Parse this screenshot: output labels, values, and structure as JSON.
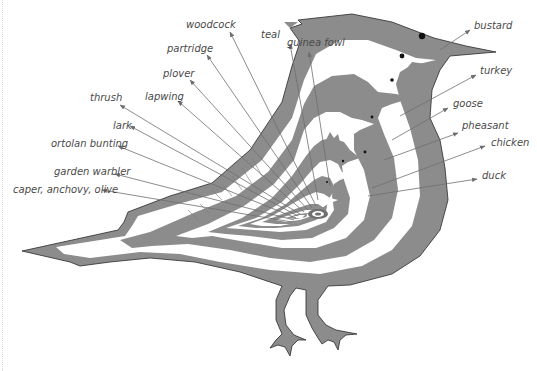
{
  "diagram": {
    "type": "nested-animals (roti sans pareil)",
    "colors": {
      "fill": "#8c8c8c",
      "inner_fill": "#ffffff",
      "outline": "#2a2a2a",
      "arrow": "#6e6e6e",
      "label": "#4a4a4a"
    },
    "labels_left": [
      {
        "id": "woodcock",
        "text": "woodcock"
      },
      {
        "id": "partridge",
        "text": "partridge"
      },
      {
        "id": "plover",
        "text": "plover"
      },
      {
        "id": "lapwing",
        "text": "lapwing"
      },
      {
        "id": "thrush",
        "text": "thrush"
      },
      {
        "id": "lark",
        "text": "lark"
      },
      {
        "id": "ortolan-bunting",
        "text": "ortolan bunting"
      },
      {
        "id": "garden-warbler",
        "text": "garden warbler"
      },
      {
        "id": "caper-anchovy-olive",
        "text": "caper, anchovy, olive"
      }
    ],
    "labels_top": [
      {
        "id": "teal",
        "text": "teal"
      },
      {
        "id": "guinea-fowl",
        "text": "guinea fowl"
      }
    ],
    "labels_right": [
      {
        "id": "bustard",
        "text": "bustard"
      },
      {
        "id": "turkey",
        "text": "turkey"
      },
      {
        "id": "goose",
        "text": "goose"
      },
      {
        "id": "pheasant",
        "text": "pheasant"
      },
      {
        "id": "chicken",
        "text": "chicken"
      },
      {
        "id": "duck",
        "text": "duck"
      }
    ]
  }
}
